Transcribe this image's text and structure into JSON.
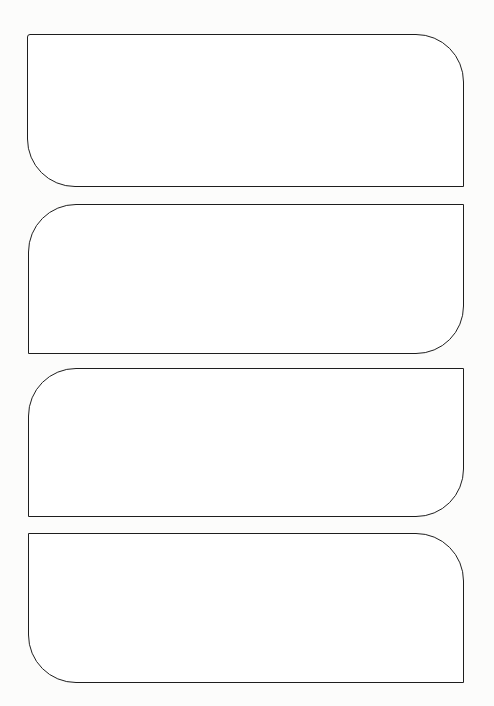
{
  "canvas": {
    "width": 494,
    "height": 706,
    "background": "#fcfcfb"
  },
  "stroke": {
    "color": "#1e1e1e",
    "width": 1.5
  },
  "shapes": [
    {
      "label": "blank-rounded-panel-1",
      "x": 27,
      "y": 34,
      "width": 437,
      "height": 153,
      "fill": "#ffffff",
      "radius": {
        "top_left": 3,
        "top_right": 48,
        "bottom_right": 0,
        "bottom_left": 48
      }
    },
    {
      "label": "blank-rounded-panel-2",
      "x": 28,
      "y": 204,
      "width": 436,
      "height": 150,
      "fill": "#ffffff",
      "radius": {
        "top_left": 48,
        "top_right": 0,
        "bottom_right": 48,
        "bottom_left": 0
      }
    },
    {
      "label": "blank-rounded-panel-3",
      "x": 28,
      "y": 368,
      "width": 436,
      "height": 149,
      "fill": "#ffffff",
      "radius": {
        "top_left": 48,
        "top_right": 0,
        "bottom_right": 48,
        "bottom_left": 0
      }
    },
    {
      "label": "blank-rounded-panel-4",
      "x": 28,
      "y": 533,
      "width": 436,
      "height": 150,
      "fill": "#ffffff",
      "radius": {
        "top_left": 0,
        "top_right": 48,
        "bottom_right": 0,
        "bottom_left": 48
      }
    }
  ]
}
